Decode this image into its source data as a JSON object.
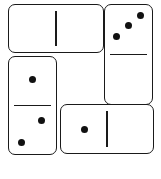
{
  "diagram": {
    "type": "domino-layout",
    "background_color": "#ffffff",
    "tile_fill_color": "#ffffff",
    "tile_outline_color": "#1a1a1a",
    "pip_color": "#111111",
    "tile_count": 4,
    "arrangement": "pinwheel"
  },
  "tiles": [
    {
      "id": "top-left",
      "name": "domino-top-left",
      "orientation": "horizontal",
      "values": [
        0,
        0
      ],
      "value_label": "0-0",
      "halves": [
        {
          "position": "left",
          "pips": 0,
          "pip_layout": []
        },
        {
          "position": "right",
          "pips": 0,
          "pip_layout": []
        }
      ]
    },
    {
      "id": "right",
      "name": "domino-right",
      "orientation": "vertical",
      "values": [
        3,
        0
      ],
      "value_label": "3-0",
      "halves": [
        {
          "position": "top",
          "pips": 3,
          "pip_layout": [
            {
              "x": 76,
              "y": 21
            },
            {
              "x": 50,
              "y": 42
            },
            {
              "x": 25,
              "y": 63
            }
          ]
        },
        {
          "position": "bottom",
          "pips": 0,
          "pip_layout": []
        }
      ]
    },
    {
      "id": "left",
      "name": "domino-left",
      "orientation": "vertical",
      "values": [
        1,
        2
      ],
      "value_label": "1-2",
      "halves": [
        {
          "position": "top",
          "pips": 1,
          "pip_layout": [
            {
              "x": 50,
              "y": 47
            }
          ]
        },
        {
          "position": "bottom",
          "pips": 2,
          "pip_layout": [
            {
              "x": 70,
              "y": 65
            },
            {
              "x": 26,
              "y": 88
            }
          ]
        }
      ]
    },
    {
      "id": "bottom",
      "name": "domino-bottom",
      "orientation": "horizontal",
      "values": [
        1,
        0
      ],
      "value_label": "1-0",
      "halves": [
        {
          "position": "left",
          "pips": 1,
          "pip_layout": [
            {
              "x": 25,
              "y": 50
            }
          ]
        },
        {
          "position": "right",
          "pips": 0,
          "pip_layout": []
        }
      ]
    }
  ]
}
